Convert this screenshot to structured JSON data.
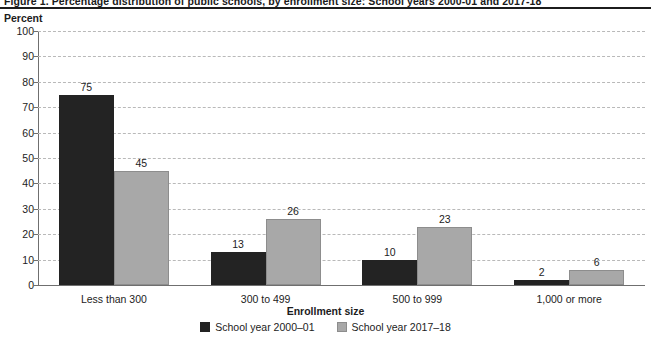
{
  "figure": {
    "title": "Figure 1. Percentage distribution of public schools, by enrollment size: School years 2000-01 and 2017-18",
    "unit_label": "Percent"
  },
  "chart_data": {
    "type": "bar",
    "title": "",
    "xlabel": "Enrollment size",
    "ylabel": "Percent",
    "ylim": [
      0,
      100
    ],
    "yticks": [
      0,
      10,
      20,
      30,
      40,
      50,
      60,
      70,
      80,
      90,
      100
    ],
    "ytick_labels": [
      "0",
      "10",
      "20",
      "30",
      "40",
      "50",
      "60",
      "70",
      "80",
      "90",
      "100"
    ],
    "grid": true,
    "legend_position": "bottom-center",
    "categories": [
      "Less than 300",
      "300 to 499",
      "500 to 999",
      "1,000 or more"
    ],
    "series": [
      {
        "name": "School year 2000–01",
        "color": "#232323",
        "values": [
          75,
          13,
          10,
          2
        ],
        "value_labels": [
          "75",
          "13",
          "10",
          "2"
        ]
      },
      {
        "name": "School year 2017–18",
        "color": "#a8a8a8",
        "values": [
          45,
          26,
          23,
          6
        ],
        "value_labels": [
          "45",
          "26",
          "23",
          "6"
        ]
      }
    ]
  }
}
